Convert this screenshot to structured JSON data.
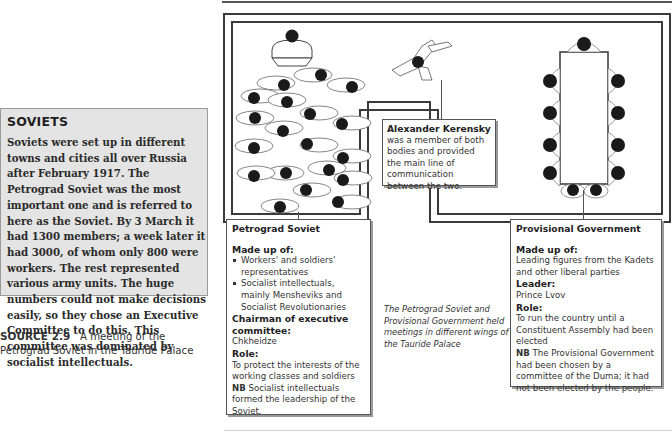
{
  "soviets_box": {
    "title": "SOVIETS",
    "body": "Soviets were set up in different towns and cities all over Russia after February 1917. The Petrograd Soviet was the most important one and is referred to here as the Soviet. By 3 March it had 1300 members; a week later it had 3000, of whom only 800 were workers. The rest represented various army units. The huge numbers could not make decisions easily, so they chose an Executive Committee to do this. This committee was dominated by socialist intellectuals."
  },
  "source_caption": {
    "label": "SOURCE 2.9",
    "text": "A meeting of the Petrograd Soviet in the Tauride Palace"
  },
  "diagram": {
    "kerensky": {
      "name": "Alexander Kerensky",
      "text": "was a member of both bodies and provided the main line of communication between the two."
    },
    "petrograd_soviet": {
      "title": "Petrograd Soviet",
      "made_up_of_label": "Made up of:",
      "made_up_of": [
        "Workers' and soldiers' representatives",
        "Socialist intellectuals, mainly Mensheviks and Socialist Revolutionaries"
      ],
      "chairman_label": "Chairman of executive committee:",
      "chairman": "Chkheidze",
      "role_label": "Role:",
      "role": "To protect the interests of the working classes and soldiers",
      "nb_label": "NB",
      "nb": "Socialist intellectuals formed the leadership of the Soviet."
    },
    "provisional_government": {
      "title": "Provisional Government",
      "made_up_of_label": "Made up of:",
      "made_up_of": "Leading figures from the Kadets and other liberal parties",
      "leader_label": "Leader:",
      "leader": "Prince Lvov",
      "role_label": "Role:",
      "role": "To run the country until a Constituent Assembly had been elected",
      "nb_label": "NB",
      "nb": "The Provisional Government had been chosen by a committee of the Duma; it had not been elected by the people."
    },
    "note": "The Petrograd Soviet and Provisional Government held meetings in different wings of the Tauride Palace",
    "soviet_member_count": 19,
    "government_member_count": 11
  }
}
